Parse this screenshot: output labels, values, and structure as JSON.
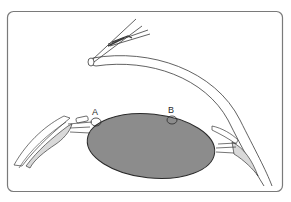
{
  "figure": {
    "type": "anatomical diagram",
    "labels": [
      {
        "id": "A",
        "text": "A"
      },
      {
        "id": "B",
        "text": "B"
      }
    ],
    "colors": {
      "frame_stroke": "#7a7a7a",
      "line": "#3a3a3a",
      "lens_fill": "#8c8c8c",
      "lens_stroke": "#2a2a2a",
      "tissue_fill": "#d9d9d9",
      "background": "#ffffff"
    }
  }
}
